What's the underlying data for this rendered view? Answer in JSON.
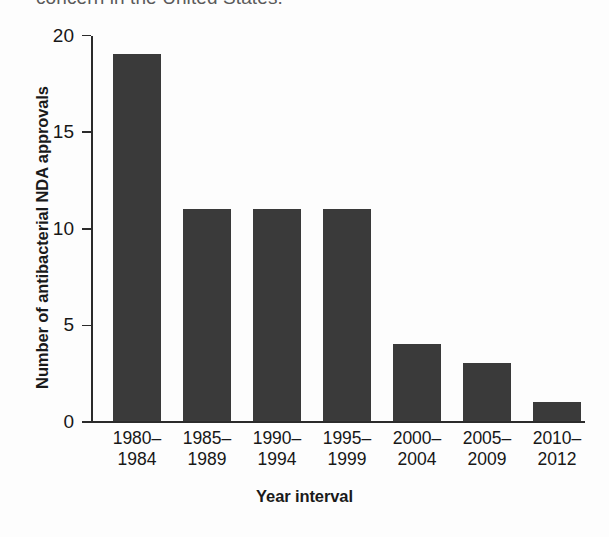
{
  "caption": {
    "clipped_line": "concern in the United States."
  },
  "chart_data": {
    "type": "bar",
    "title": "",
    "xlabel": "Year interval",
    "ylabel": "Number of antibacterial NDA approvals",
    "categories": [
      "1980–1984",
      "1985–1989",
      "1990–1994",
      "1995–1999",
      "2000–2004",
      "2005–2009",
      "2010–2012"
    ],
    "category_lines": [
      [
        "1980–",
        "1984"
      ],
      [
        "1985–",
        "1989"
      ],
      [
        "1990–",
        "1994"
      ],
      [
        "1995–",
        "1999"
      ],
      [
        "2000–",
        "2004"
      ],
      [
        "2005–",
        "2009"
      ],
      [
        "2010–",
        "2012"
      ]
    ],
    "values": [
      19,
      11,
      11,
      11,
      4,
      3,
      1
    ],
    "ylim": [
      0,
      20
    ],
    "yticks": [
      0,
      5,
      10,
      15,
      20
    ],
    "ytick_labels": [
      "0",
      "5",
      "10",
      "15",
      "20"
    ],
    "grid": false,
    "legend": false,
    "bar_color": "#3a3a3a",
    "axis_color": "#2b2b2b",
    "background_color": "#fdfdfd"
  }
}
